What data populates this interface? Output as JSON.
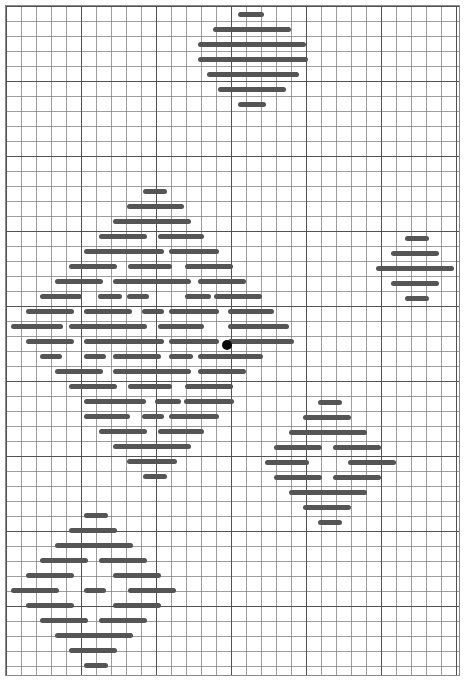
{
  "figure": {
    "background_color": "#ffffff",
    "width": 466,
    "height": 686
  },
  "grid": {
    "name": "graph-paper-grid",
    "minor_cell_px": 15,
    "major_cell_px": 75,
    "minor_line_color": "#7d7d7d",
    "major_line_color": "#464646",
    "border_color": "#8a8a8a",
    "origin_x": 5,
    "origin_y": 5,
    "grid_width": 455,
    "grid_height": 671
  },
  "style": {
    "dash_color": "#555555",
    "dash_height": 5,
    "dash_radius": 2.5,
    "marker_color": "#0a0a0a",
    "marker_diameter": 10
  },
  "chart_data": {
    "type": "scatter",
    "subtitle": "",
    "xlabel": "",
    "ylabel": "",
    "xlim": [
      0,
      466
    ],
    "ylim": [
      0,
      686
    ],
    "grid": true,
    "legend": null,
    "units": "pixels",
    "marker_points": [
      {
        "name": "center-marker",
        "x": 227,
        "y": 345,
        "d": 10,
        "color": "#0a0a0a"
      }
    ],
    "clusters": [
      {
        "name": "top-cluster",
        "center_x": 252,
        "center_y": 62,
        "rows": [
          {
            "y": 14,
            "dashes": [
              {
                "x": 238,
                "w": 26
              }
            ]
          },
          {
            "y": 29,
            "dashes": [
              {
                "x": 213,
                "w": 78
              }
            ]
          },
          {
            "y": 44,
            "dashes": [
              {
                "x": 198,
                "w": 108
              }
            ]
          },
          {
            "y": 59,
            "dashes": [
              {
                "x": 198,
                "w": 110
              }
            ]
          },
          {
            "y": 74,
            "dashes": [
              {
                "x": 207,
                "w": 92
              }
            ]
          },
          {
            "y": 89,
            "dashes": [
              {
                "x": 218,
                "w": 68
              }
            ]
          },
          {
            "y": 104,
            "dashes": [
              {
                "x": 238,
                "w": 28
              }
            ]
          }
        ]
      },
      {
        "name": "main-cluster",
        "center_x": 150,
        "center_y": 345,
        "rows": [
          {
            "y": 191,
            "dashes": [
              {
                "x": 143,
                "w": 24
              }
            ]
          },
          {
            "y": 206,
            "dashes": [
              {
                "x": 127,
                "w": 50
              },
              {
                "x": 152,
                "w": 32
              }
            ]
          },
          {
            "y": 221,
            "dashes": [
              {
                "x": 113,
                "w": 78
              }
            ]
          },
          {
            "y": 236,
            "dashes": [
              {
                "x": 99,
                "w": 48
              },
              {
                "x": 158,
                "w": 46
              }
            ]
          },
          {
            "y": 251,
            "dashes": [
              {
                "x": 84,
                "w": 62
              },
              {
                "x": 142,
                "w": 22
              },
              {
                "x": 169,
                "w": 50
              }
            ]
          },
          {
            "y": 266,
            "dashes": [
              {
                "x": 69,
                "w": 48
              },
              {
                "x": 128,
                "w": 44
              },
              {
                "x": 185,
                "w": 48
              }
            ]
          },
          {
            "y": 281,
            "dashes": [
              {
                "x": 55,
                "w": 48
              },
              {
                "x": 113,
                "w": 78
              },
              {
                "x": 198,
                "w": 48
              }
            ]
          },
          {
            "y": 296,
            "dashes": [
              {
                "x": 40,
                "w": 42
              },
              {
                "x": 98,
                "w": 24
              },
              {
                "x": 127,
                "w": 22
              },
              {
                "x": 185,
                "w": 26
              },
              {
                "x": 214,
                "w": 48
              }
            ]
          },
          {
            "y": 311,
            "dashes": [
              {
                "x": 26,
                "w": 48
              },
              {
                "x": 84,
                "w": 48
              },
              {
                "x": 142,
                "w": 22
              },
              {
                "x": 169,
                "w": 50
              },
              {
                "x": 228,
                "w": 46
              }
            ]
          },
          {
            "y": 326,
            "dashes": [
              {
                "x": 11,
                "w": 52
              },
              {
                "x": 69,
                "w": 78
              },
              {
                "x": 158,
                "w": 46
              },
              {
                "x": 228,
                "w": 48
              },
              {
                "x": 241,
                "w": 48
              }
            ]
          },
          {
            "y": 341,
            "dashes": [
              {
                "x": 26,
                "w": 48
              },
              {
                "x": 84,
                "w": 62
              },
              {
                "x": 142,
                "w": 22
              },
              {
                "x": 169,
                "w": 50
              },
              {
                "x": 228,
                "w": 66
              }
            ]
          },
          {
            "y": 356,
            "dashes": [
              {
                "x": 40,
                "w": 22
              },
              {
                "x": 84,
                "w": 22
              },
              {
                "x": 113,
                "w": 48
              },
              {
                "x": 169,
                "w": 24
              },
              {
                "x": 198,
                "w": 48
              },
              {
                "x": 241,
                "w": 22
              }
            ]
          },
          {
            "y": 371,
            "dashes": [
              {
                "x": 55,
                "w": 48
              },
              {
                "x": 113,
                "w": 78
              },
              {
                "x": 198,
                "w": 48
              }
            ]
          },
          {
            "y": 386,
            "dashes": [
              {
                "x": 69,
                "w": 48
              },
              {
                "x": 128,
                "w": 44
              },
              {
                "x": 185,
                "w": 48
              }
            ]
          },
          {
            "y": 401,
            "dashes": [
              {
                "x": 84,
                "w": 62
              },
              {
                "x": 155,
                "w": 26
              },
              {
                "x": 184,
                "w": 50
              }
            ]
          },
          {
            "y": 416,
            "dashes": [
              {
                "x": 84,
                "w": 46
              },
              {
                "x": 142,
                "w": 22
              },
              {
                "x": 169,
                "w": 50
              }
            ]
          },
          {
            "y": 431,
            "dashes": [
              {
                "x": 99,
                "w": 48
              },
              {
                "x": 158,
                "w": 46
              }
            ]
          },
          {
            "y": 446,
            "dashes": [
              {
                "x": 113,
                "w": 78
              }
            ]
          },
          {
            "y": 461,
            "dashes": [
              {
                "x": 127,
                "w": 50
              }
            ]
          },
          {
            "y": 476,
            "dashes": [
              {
                "x": 143,
                "w": 24
              }
            ]
          }
        ]
      },
      {
        "name": "right-edge-cluster",
        "center_x": 430,
        "center_y": 273,
        "rows": [
          {
            "y": 238,
            "dashes": [
              {
                "x": 405,
                "w": 24
              }
            ]
          },
          {
            "y": 253,
            "dashes": [
              {
                "x": 391,
                "w": 48
              }
            ]
          },
          {
            "y": 268,
            "dashes": [
              {
                "x": 376,
                "w": 78
              }
            ]
          },
          {
            "y": 283,
            "dashes": [
              {
                "x": 391,
                "w": 48
              }
            ]
          },
          {
            "y": 298,
            "dashes": [
              {
                "x": 405,
                "w": 24
              }
            ]
          }
        ]
      },
      {
        "name": "bottom-right-cluster",
        "center_x": 333,
        "center_y": 460,
        "rows": [
          {
            "y": 402,
            "dashes": [
              {
                "x": 318,
                "w": 24
              }
            ]
          },
          {
            "y": 417,
            "dashes": [
              {
                "x": 303,
                "w": 48
              }
            ]
          },
          {
            "y": 432,
            "dashes": [
              {
                "x": 289,
                "w": 78
              }
            ]
          },
          {
            "y": 447,
            "dashes": [
              {
                "x": 274,
                "w": 48
              },
              {
                "x": 333,
                "w": 48
              }
            ]
          },
          {
            "y": 462,
            "dashes": [
              {
                "x": 265,
                "w": 44
              },
              {
                "x": 348,
                "w": 48
              }
            ]
          },
          {
            "y": 477,
            "dashes": [
              {
                "x": 274,
                "w": 48
              },
              {
                "x": 333,
                "w": 48
              }
            ]
          },
          {
            "y": 492,
            "dashes": [
              {
                "x": 289,
                "w": 78
              }
            ]
          },
          {
            "y": 507,
            "dashes": [
              {
                "x": 303,
                "w": 48
              }
            ]
          },
          {
            "y": 522,
            "dashes": [
              {
                "x": 318,
                "w": 24
              }
            ]
          }
        ]
      },
      {
        "name": "bottom-left-cluster",
        "center_x": 92,
        "center_y": 590,
        "rows": [
          {
            "y": 515,
            "dashes": [
              {
                "x": 84,
                "w": 24
              }
            ]
          },
          {
            "y": 530,
            "dashes": [
              {
                "x": 69,
                "w": 48
              }
            ]
          },
          {
            "y": 545,
            "dashes": [
              {
                "x": 55,
                "w": 78
              }
            ]
          },
          {
            "y": 560,
            "dashes": [
              {
                "x": 40,
                "w": 48
              },
              {
                "x": 99,
                "w": 48
              }
            ]
          },
          {
            "y": 575,
            "dashes": [
              {
                "x": 26,
                "w": 48
              },
              {
                "x": 113,
                "w": 48
              }
            ]
          },
          {
            "y": 590,
            "dashes": [
              {
                "x": 11,
                "w": 48
              },
              {
                "x": 84,
                "w": 22
              },
              {
                "x": 128,
                "w": 48
              }
            ]
          },
          {
            "y": 605,
            "dashes": [
              {
                "x": 26,
                "w": 48
              },
              {
                "x": 113,
                "w": 48
              }
            ]
          },
          {
            "y": 620,
            "dashes": [
              {
                "x": 40,
                "w": 48
              },
              {
                "x": 99,
                "w": 48
              }
            ]
          },
          {
            "y": 635,
            "dashes": [
              {
                "x": 55,
                "w": 78
              }
            ]
          },
          {
            "y": 650,
            "dashes": [
              {
                "x": 69,
                "w": 48
              }
            ]
          },
          {
            "y": 665,
            "dashes": [
              {
                "x": 84,
                "w": 24
              }
            ]
          }
        ]
      }
    ]
  }
}
